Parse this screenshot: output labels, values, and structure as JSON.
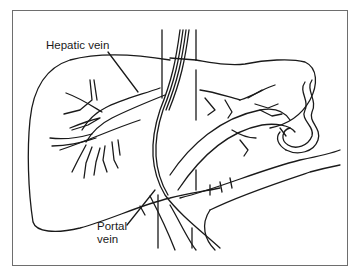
{
  "figure": {
    "type": "anatomical line drawing",
    "labels": {
      "hepatic_vein": "Hepatic vein",
      "portal_vein_line1": "Portal",
      "portal_vein_line2": "vein"
    },
    "colors": {
      "stroke": "#1a1a1a",
      "frame": "#6e6e6e",
      "background": "#ffffff"
    }
  }
}
